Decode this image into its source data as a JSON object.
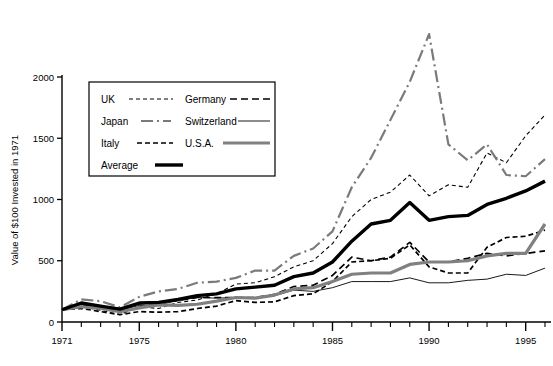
{
  "chart_data": {
    "type": "line",
    "title": "",
    "xlabel": "",
    "ylabel": "Value of $100 Invested in 1971",
    "xlim": [
      1971,
      1996
    ],
    "ylim": [
      0,
      2000
    ],
    "grid": false,
    "legend_position": "upper-left-inset",
    "y_ticks": [
      "0",
      "500",
      "1000",
      "1500",
      "2000"
    ],
    "y_tick_values": [
      0,
      500,
      1000,
      1500,
      2000
    ],
    "x_ticks": [
      "1971",
      "1975",
      "1980",
      "1985",
      "1990",
      "1995"
    ],
    "x_tick_values": [
      1971,
      1975,
      1980,
      1985,
      1990,
      1995
    ],
    "x_minor_step": 1,
    "x": [
      1971,
      1972,
      1973,
      1974,
      1975,
      1976,
      1977,
      1978,
      1979,
      1980,
      1981,
      1982,
      1983,
      1984,
      1985,
      1986,
      1987,
      1988,
      1989,
      1990,
      1991,
      1992,
      1993,
      1994,
      1995,
      1996
    ],
    "series": [
      {
        "name": "UK",
        "style": "fine-dashed",
        "color": "#000000",
        "width": 1.1,
        "dash": "4,3",
        "values": [
          100,
          125,
          95,
          60,
          125,
          110,
          160,
          180,
          230,
          310,
          320,
          370,
          450,
          500,
          640,
          860,
          1000,
          1060,
          1200,
          1030,
          1120,
          1100,
          1380,
          1300,
          1520,
          1690
        ]
      },
      {
        "name": "Germany",
        "style": "dashed",
        "color": "#000000",
        "width": 1.7,
        "dash": "7,4",
        "values": [
          100,
          140,
          120,
          110,
          150,
          155,
          175,
          200,
          200,
          200,
          200,
          225,
          290,
          300,
          380,
          530,
          500,
          530,
          650,
          490,
          490,
          520,
          560,
          540,
          560,
          580
        ]
      },
      {
        "name": "Japan",
        "style": "dash-dot",
        "color": "#7a7a7a",
        "width": 2.2,
        "dash": "12,4,2,4",
        "values": [
          100,
          185,
          170,
          120,
          205,
          250,
          270,
          320,
          330,
          360,
          420,
          420,
          540,
          600,
          740,
          1100,
          1340,
          1650,
          1960,
          2350,
          1450,
          1320,
          1450,
          1200,
          1190,
          1330
        ]
      },
      {
        "name": "Switzerland",
        "style": "thin-solid",
        "color": "#000000",
        "width": 0.9,
        "dash": "",
        "values": [
          100,
          120,
          105,
          95,
          135,
          140,
          175,
          200,
          195,
          200,
          200,
          215,
          260,
          250,
          280,
          330,
          330,
          330,
          360,
          320,
          320,
          340,
          350,
          390,
          380,
          440
        ]
      },
      {
        "name": "Italy",
        "style": "short-dashed",
        "color": "#000000",
        "width": 1.7,
        "dash": "5,3",
        "values": [
          100,
          110,
          85,
          60,
          85,
          80,
          85,
          110,
          130,
          175,
          160,
          165,
          215,
          230,
          330,
          490,
          500,
          520,
          630,
          450,
          400,
          400,
          610,
          690,
          700,
          750
        ]
      },
      {
        "name": "U.S.A.",
        "style": "thick-gray",
        "color": "#808080",
        "width": 3.2,
        "dash": "",
        "values": [
          100,
          125,
          110,
          85,
          115,
          140,
          135,
          145,
          170,
          200,
          195,
          220,
          270,
          280,
          330,
          390,
          400,
          400,
          470,
          490,
          490,
          500,
          540,
          560,
          560,
          800
        ]
      },
      {
        "name": "Average",
        "style": "thick-black",
        "color": "#000000",
        "width": 3.4,
        "dash": "",
        "values": [
          100,
          155,
          130,
          105,
          155,
          160,
          185,
          215,
          230,
          270,
          285,
          300,
          370,
          400,
          490,
          660,
          800,
          830,
          975,
          830,
          860,
          870,
          960,
          1010,
          1070,
          1150
        ]
      }
    ],
    "legend": [
      {
        "label": "UK",
        "series": "UK"
      },
      {
        "label": "Germany",
        "series": "Germany"
      },
      {
        "label": "Japan",
        "series": "Japan"
      },
      {
        "label": "Switzerland",
        "series": "Switzerland"
      },
      {
        "label": "Italy",
        "series": "Italy"
      },
      {
        "label": "U.S.A.",
        "series": "U.S.A."
      },
      {
        "label": "Average",
        "series": "Average"
      }
    ]
  },
  "colors": {
    "axis": "#000000",
    "gray_series": "#808080",
    "japan_gray": "#7a7a7a",
    "background": "#ffffff"
  }
}
